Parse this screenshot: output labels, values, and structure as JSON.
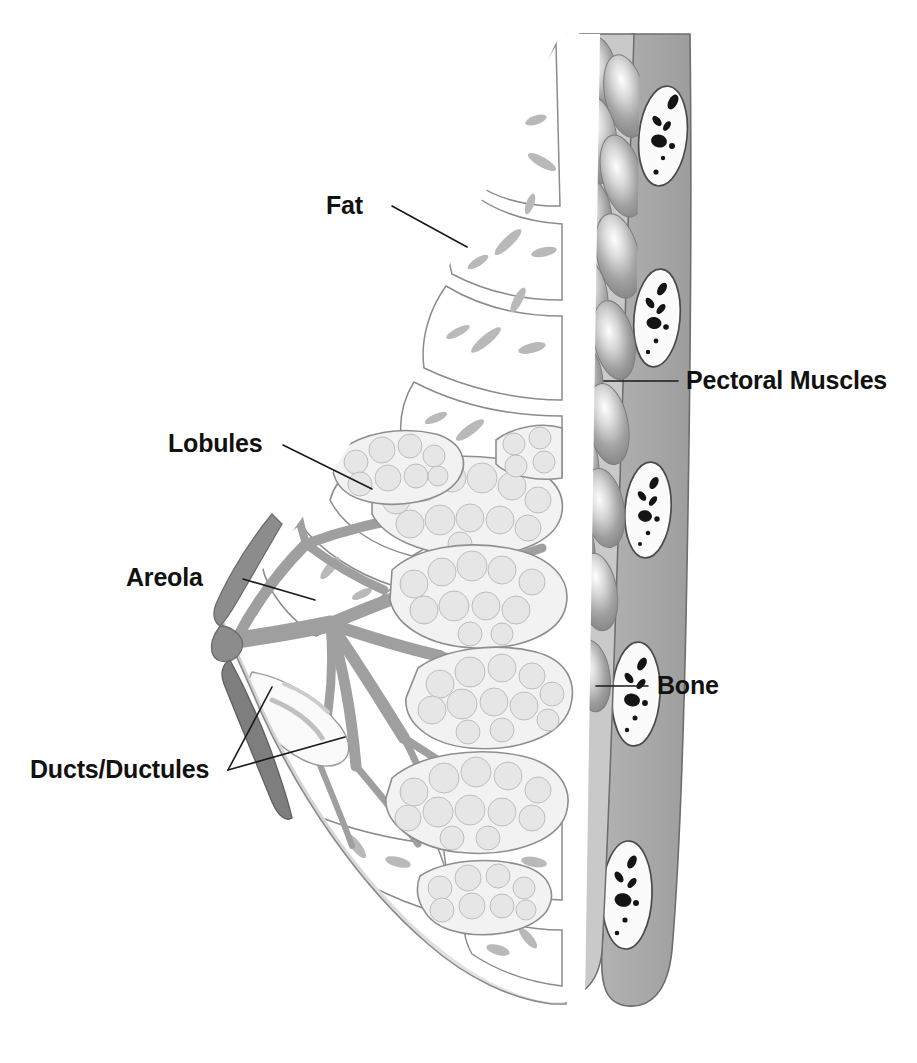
{
  "figure": {
    "type": "anatomical-illustration",
    "view": "sagittal cross-section of the female breast and chest wall",
    "background_color": "#ffffff",
    "line_color": "#1a1a1a"
  },
  "labels": [
    {
      "id": "fat",
      "text": "Fat",
      "text_x": 326,
      "text_y": 214,
      "anchor": "start",
      "leader": "M 392 206 L 467 247",
      "points_to": "adipose tissue compartments in upper breast"
    },
    {
      "id": "lobules",
      "text": "Lobules",
      "text_x": 168,
      "text_y": 452,
      "anchor": "start",
      "leader": "M 283 445 L 372 489",
      "points_to": "milk-producing glandular lobules"
    },
    {
      "id": "areola",
      "text": "Areola",
      "text_x": 126,
      "text_y": 586,
      "anchor": "start",
      "leader": "M 243 579 L 315 600",
      "points_to": "pigmented areola around the nipple"
    },
    {
      "id": "ducts-ductules",
      "text": "Ducts/Ductules",
      "text_x": 30,
      "text_y": 778,
      "anchor": "start",
      "leader": "M 228 770 L 272 687",
      "leader2": "M 228 770 L 345 737",
      "points_to": "branching milk ducts converging at the nipple"
    },
    {
      "id": "pectoral-muscles",
      "text": "Pectoral Muscles",
      "text_x": 686,
      "text_y": 389,
      "anchor": "start",
      "leader": "M 678 381 L 604 381",
      "points_to": "pectoralis muscle bundles of the chest wall"
    },
    {
      "id": "bone",
      "text": "Bone",
      "text_x": 657,
      "text_y": 694,
      "anchor": "start",
      "leader": "M 648 686 L 596 686",
      "points_to": "rib bone with marrow in cross-section"
    }
  ],
  "structures": {
    "skin": {
      "name": "skin",
      "color": "#d9d9d9",
      "outline": "#8a8a8a"
    },
    "fat": {
      "name": "adipose tissue",
      "color": "#ffffff",
      "septa_color": "#b4b4b4",
      "outline": "#6f6f6f"
    },
    "lobules": {
      "name": "lobules",
      "color": "#f0f0f0",
      "acini_color": "#e2e2e2",
      "outline": "#909090"
    },
    "ducts": {
      "name": "ducts and ductules",
      "color": "#9f9f9f"
    },
    "areola": {
      "name": "areola",
      "color": "#8c8c8c"
    },
    "nipple": {
      "name": "nipple",
      "color": "#8c8c8c"
    },
    "pectoral_muscle": {
      "name": "pectoral muscles",
      "color": "#9a9a9a",
      "highlight": "#f2f2f2"
    },
    "chest_wall": {
      "name": "chest wall",
      "color": "#a9a9a9"
    },
    "bone": {
      "name": "rib bone",
      "color": "#fbfbfb",
      "marrow_color": "#141414",
      "outline": "#4b4b4b"
    }
  },
  "counts": {
    "ribs_visible": 4,
    "muscle_bundles": 14,
    "lobule_clusters": 7,
    "fat_compartments": 9,
    "labels": 6
  }
}
